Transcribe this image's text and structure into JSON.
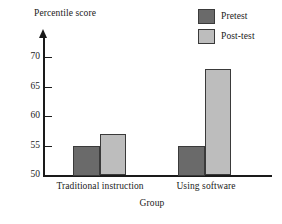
{
  "chart_data": {
    "type": "bar",
    "title": "",
    "ylabel": "Percentile score",
    "xlabel": "Group",
    "categories": [
      "Traditional instruction",
      "Using software"
    ],
    "series": [
      {
        "name": "Pretest",
        "values": [
          55,
          55
        ],
        "color": "#6a6a6a"
      },
      {
        "name": "Post-test",
        "values": [
          57,
          68
        ],
        "color": "#bdbdbd"
      }
    ],
    "ylim": [
      50,
      71
    ],
    "yticks": [
      50,
      55,
      60,
      65,
      70
    ],
    "ytick_labels": [
      "50",
      "55",
      "60",
      "65",
      "70"
    ],
    "grid": false,
    "legend_position": "top-right",
    "axis_color": "#1a1a1a"
  },
  "legend": {
    "entries": [
      {
        "label": "Pretest"
      },
      {
        "label": "Post-test"
      }
    ]
  },
  "axis": {
    "y_title": "Percentile score",
    "x_title": "Group",
    "tick_50": "50",
    "tick_55": "55",
    "tick_60": "60",
    "tick_65": "65",
    "tick_70": "70"
  },
  "categories": {
    "cat_0": "Traditional instruction",
    "cat_1": "Using software"
  }
}
